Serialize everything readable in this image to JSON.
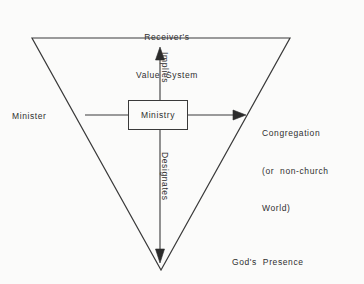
{
  "figure": {
    "type": "concept-diagram",
    "shape": "inverted-triangle",
    "background_color": "#fbfbfa",
    "stroke_color": "#3a3a3a",
    "text_color": "#2f2f2f"
  },
  "triangle": {
    "vertices": [
      {
        "name": "top-left",
        "x": 32,
        "y": 38
      },
      {
        "name": "top-right",
        "x": 290,
        "y": 38
      },
      {
        "name": "bottom",
        "x": 161,
        "y": 270
      }
    ]
  },
  "center_node": {
    "label": "Ministry",
    "box": {
      "x": 128,
      "y": 100,
      "width": 60,
      "height": 30
    }
  },
  "vertex_labels": {
    "top": {
      "line1": "Receiver's",
      "line2": "Value  System"
    },
    "left": "Minister",
    "right": {
      "line1": "Congregation",
      "line2": "(or  non-church",
      "line3": "World)"
    },
    "bottom": "God's  Presence"
  },
  "edge_labels": {
    "up": "Implies",
    "down": "Designates"
  },
  "arrows": [
    {
      "name": "minister-to-ministry",
      "direction": "right",
      "from": [
        85,
        115
      ],
      "to": [
        128,
        115
      ],
      "arrowhead": false
    },
    {
      "name": "ministry-to-congregation",
      "direction": "right",
      "from": [
        188,
        115
      ],
      "to": [
        245,
        115
      ],
      "arrowhead": true
    },
    {
      "name": "ministry-implies-value-system",
      "direction": "up",
      "from": [
        160,
        100
      ],
      "to": [
        160,
        48
      ],
      "arrowhead": true
    },
    {
      "name": "ministry-designates-gods-presence",
      "direction": "down",
      "from": [
        160,
        130
      ],
      "to": [
        160,
        262
      ],
      "arrowhead": true
    }
  ]
}
